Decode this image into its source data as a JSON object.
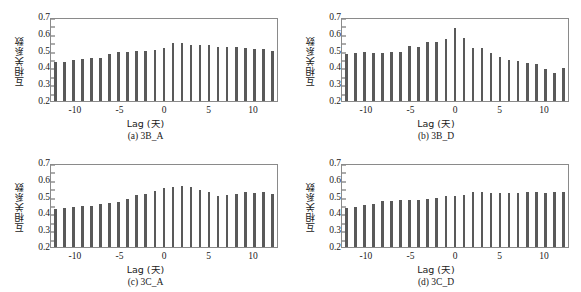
{
  "figure": {
    "panel_count": 4,
    "bar_color": "#595959",
    "axis_color": "#8a8a8a",
    "background": "#ffffff"
  },
  "chart_data": [
    {
      "type": "bar",
      "panel_id": "a",
      "caption": "(a) 3B_A",
      "title": "",
      "xlabel": "Lag (天)",
      "ylabel": "互相关系数",
      "xlim": [
        -12.8,
        12.8
      ],
      "ylim": [
        0.2,
        0.7
      ],
      "ytick_labels": [
        "0.7",
        "0.6",
        "0.5",
        "0.4",
        "0.3",
        "0.2"
      ],
      "ytick_values": [
        0.7,
        0.6,
        0.5,
        0.4,
        0.3,
        0.2
      ],
      "xtick_labels": [
        "-10",
        "-5",
        "0",
        "5",
        "10"
      ],
      "xtick_values": [
        -10,
        -5,
        0,
        5,
        10
      ],
      "grid": false,
      "legend": "none",
      "x": [
        -12,
        -11,
        -10,
        -9,
        -8,
        -7,
        -6,
        -5,
        -4,
        -3,
        -2,
        -1,
        0,
        1,
        2,
        3,
        4,
        5,
        6,
        7,
        8,
        9,
        10,
        11,
        12
      ],
      "values": [
        0.432,
        0.434,
        0.442,
        0.449,
        0.459,
        0.456,
        0.479,
        0.492,
        0.491,
        0.495,
        0.498,
        0.505,
        0.518,
        0.543,
        0.545,
        0.532,
        0.535,
        0.531,
        0.524,
        0.52,
        0.519,
        0.513,
        0.511,
        0.511,
        0.497
      ]
    },
    {
      "type": "bar",
      "panel_id": "b",
      "caption": "(b) 3B_D",
      "title": "",
      "xlabel": "Lag (天)",
      "ylabel": "互相关系数",
      "xlim": [
        -12.8,
        12.8
      ],
      "ylim": [
        0.2,
        0.7
      ],
      "ytick_labels": [
        "0.7",
        "0.6",
        "0.5",
        "0.4",
        "0.3",
        "0.2"
      ],
      "ytick_values": [
        0.7,
        0.6,
        0.5,
        0.4,
        0.3,
        0.2
      ],
      "xtick_labels": [
        "-10",
        "-5",
        "0",
        "5",
        "10"
      ],
      "xtick_values": [
        -10,
        -5,
        0,
        5,
        10
      ],
      "grid": false,
      "legend": "none",
      "x": [
        -12,
        -11,
        -10,
        -9,
        -8,
        -7,
        -6,
        -5,
        -4,
        -3,
        -2,
        -1,
        0,
        1,
        2,
        3,
        4,
        5,
        6,
        7,
        8,
        9,
        10,
        11,
        12
      ],
      "values": [
        0.479,
        0.488,
        0.49,
        0.486,
        0.488,
        0.489,
        0.489,
        0.53,
        0.519,
        0.552,
        0.55,
        0.567,
        0.637,
        0.575,
        0.513,
        0.513,
        0.487,
        0.462,
        0.446,
        0.437,
        0.428,
        0.421,
        0.391,
        0.364,
        0.397
      ]
    },
    {
      "type": "bar",
      "panel_id": "c",
      "caption": "(c) 3C_A",
      "title": "",
      "xlabel": "Lag (天)",
      "ylabel": "互相关系数",
      "xlim": [
        -12.8,
        12.8
      ],
      "ylim": [
        0.2,
        0.7
      ],
      "ytick_labels": [
        "0.7",
        "0.6",
        "0.5",
        "0.4",
        "0.3",
        "0.2"
      ],
      "ytick_values": [
        0.7,
        0.6,
        0.5,
        0.4,
        0.3,
        0.2
      ],
      "xtick_labels": [
        "-10",
        "-5",
        "0",
        "5",
        "10"
      ],
      "xtick_values": [
        -10,
        -5,
        0,
        5,
        10
      ],
      "grid": false,
      "legend": "none",
      "x": [
        -12,
        -11,
        -10,
        -9,
        -8,
        -7,
        -6,
        -5,
        -4,
        -3,
        -2,
        -1,
        0,
        1,
        2,
        3,
        4,
        5,
        6,
        7,
        8,
        9,
        10,
        11,
        12
      ],
      "values": [
        0.428,
        0.43,
        0.437,
        0.443,
        0.443,
        0.456,
        0.462,
        0.47,
        0.485,
        0.507,
        0.517,
        0.532,
        0.549,
        0.557,
        0.564,
        0.558,
        0.54,
        0.527,
        0.505,
        0.508,
        0.518,
        0.525,
        0.52,
        0.527,
        0.513
      ]
    },
    {
      "type": "bar",
      "panel_id": "d",
      "caption": "(d) 3C_D",
      "title": "",
      "xlabel": "Lag (天)",
      "ylabel": "互相关系数",
      "xlim": [
        -12.8,
        12.8
      ],
      "ylim": [
        0.2,
        0.7
      ],
      "ytick_labels": [
        "0.7",
        "0.6",
        "0.5",
        "0.4",
        "0.3",
        "0.2"
      ],
      "ytick_values": [
        0.7,
        0.6,
        0.5,
        0.4,
        0.3,
        0.2
      ],
      "xtick_labels": [
        "-10",
        "-5",
        "0",
        "5",
        "10"
      ],
      "xtick_values": [
        -10,
        -5,
        0,
        5,
        10
      ],
      "grid": false,
      "legend": "none",
      "x": [
        -12,
        -11,
        -10,
        -9,
        -8,
        -7,
        -6,
        -5,
        -4,
        -3,
        -2,
        -1,
        0,
        1,
        2,
        3,
        4,
        5,
        6,
        7,
        8,
        9,
        10,
        11,
        12
      ],
      "values": [
        0.433,
        0.441,
        0.45,
        0.459,
        0.473,
        0.474,
        0.478,
        0.48,
        0.482,
        0.487,
        0.492,
        0.501,
        0.504,
        0.507,
        0.527,
        0.528,
        0.522,
        0.521,
        0.521,
        0.521,
        0.529,
        0.525,
        0.524,
        0.525,
        0.53
      ]
    }
  ]
}
